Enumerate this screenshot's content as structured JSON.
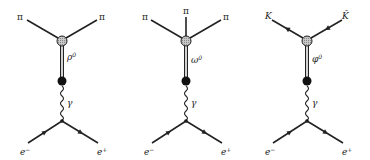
{
  "diagrams": [
    {
      "name": "rho-production",
      "final_state": [
        "π",
        "π"
      ],
      "resonance": "ρ",
      "resonance_sup": "0",
      "propagator": "γ",
      "initial_left": "e",
      "initial_left_sup": "−",
      "initial_right": "e",
      "initial_right_sup": "+"
    },
    {
      "name": "omega-production",
      "final_state": [
        "π",
        "π",
        "π"
      ],
      "resonance": "ω",
      "resonance_sup": "0",
      "propagator": "γ",
      "initial_left": "e",
      "initial_left_sup": "−",
      "initial_right": "e",
      "initial_right_sup": "+"
    },
    {
      "name": "phi-production",
      "final_state": [
        "K",
        "K̄"
      ],
      "resonance": "φ",
      "resonance_sup": "0",
      "propagator": "γ",
      "initial_left": "e",
      "initial_left_sup": "−",
      "initial_right": "e",
      "initial_right_sup": "+"
    }
  ],
  "colors": {
    "ink": "#222222",
    "blob_fill": "#b8b8b8",
    "dot_fill": "#111111",
    "background": "#ffffff"
  }
}
